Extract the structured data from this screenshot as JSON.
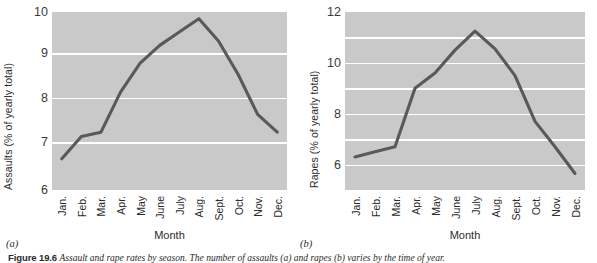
{
  "figure": {
    "caption_head": "Figure 19.6",
    "caption_body": "Assault and rape rates by season. The number of assaults (a) and rapes (b) varies by the time of year.",
    "background": "#ffffff",
    "plot_background": "#c9c9c9",
    "grid_color": "#ffffff",
    "line_color": "#595959"
  },
  "panels": [
    {
      "letter": "(a)"
    },
    {
      "letter": "(b)"
    }
  ],
  "chart_data": [
    {
      "type": "line",
      "panel": "(a)",
      "title": "",
      "xlabel": "Month",
      "ylabel": "Assaults (% of yearly total)",
      "categories": [
        "Jan.",
        "Feb.",
        "Mar.",
        "Apr.",
        "May",
        "June",
        "July",
        "Aug.",
        "Sept.",
        "Oct.",
        "Nov.",
        "Dec."
      ],
      "values": [
        6.7,
        7.2,
        7.3,
        8.2,
        8.85,
        9.25,
        9.55,
        9.85,
        9.35,
        8.6,
        7.7,
        7.3
      ],
      "ylim": [
        6,
        10
      ],
      "yticks": [
        6,
        7,
        8,
        9,
        10
      ],
      "ytick_labels": [
        "6",
        "7",
        "8",
        "9",
        "10"
      ],
      "gridlines": [
        7,
        8,
        9
      ],
      "grid": true,
      "legend": false
    },
    {
      "type": "line",
      "panel": "(b)",
      "title": "",
      "xlabel": "Month",
      "ylabel": "Rapes (% of yearly total)",
      "categories": [
        "Jan.",
        "Feb.",
        "Mar.",
        "Apr.",
        "May",
        "June",
        "July",
        "Aug.",
        "Sept.",
        "Oct.",
        "Nov.",
        "Dec."
      ],
      "values": [
        6.3,
        6.5,
        6.7,
        9.0,
        9.6,
        10.5,
        11.25,
        10.55,
        9.5,
        7.7,
        6.7,
        5.65
      ],
      "ylim": [
        5,
        12
      ],
      "yticks": [
        6,
        8,
        10,
        12
      ],
      "ytick_labels": [
        "6",
        "8",
        "10",
        "12"
      ],
      "gridlines": [
        6,
        7,
        8,
        9,
        10,
        11
      ],
      "grid": true,
      "legend": false
    }
  ]
}
